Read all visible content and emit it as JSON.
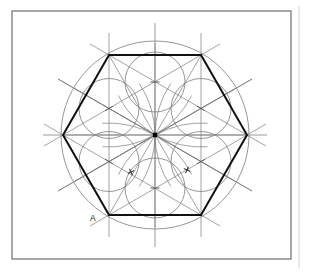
{
  "page": {
    "width": 312,
    "height": 274,
    "background": "#ffffff"
  },
  "frame": {
    "name": "drawing-border",
    "x": 12,
    "y": 11,
    "width": 279,
    "height": 248,
    "stroke": "#6e6e6e",
    "stroke_width": 1.2
  },
  "right_rule": {
    "name": "page-edge-rule",
    "x": 299,
    "y1": 6,
    "y2": 268,
    "stroke": "#cfcfcf",
    "stroke_width": 1
  },
  "caption": {
    "text": "",
    "color": "#c9c9c9"
  },
  "colors": {
    "heavy_line": "#111111",
    "thin_line": "#7a7a7a",
    "construction_line": "#8c8c8c",
    "circle_line": "#8a8a8a",
    "center_dot": "#000000",
    "label": "#1a1a1a"
  },
  "geometry": {
    "center": {
      "x": 155,
      "y": 135
    },
    "circumscribed_circle": {
      "name": "outer-circle",
      "cx": 155,
      "cy": 135,
      "r": 94,
      "stroke": "#8a8a8a",
      "stroke_width": 0.9
    },
    "hexagon": {
      "name": "hexagon",
      "circumradius": 92,
      "rotation_deg": 0,
      "stroke": "#111111",
      "stroke_width": 2.0,
      "vertices": [
        {
          "id": "V0",
          "x": 247,
          "y": 135,
          "label": ""
        },
        {
          "id": "V1",
          "x": 201,
          "y": 55,
          "label": ""
        },
        {
          "id": "V2",
          "x": 109,
          "y": 55,
          "label": ""
        },
        {
          "id": "V3",
          "x": 63,
          "y": 135,
          "label": ""
        },
        {
          "id": "V4",
          "x": 109,
          "y": 215,
          "label": "A"
        },
        {
          "id": "V5",
          "x": 201,
          "y": 215,
          "label": ""
        }
      ]
    },
    "inner_circles": {
      "name": "inscribed-circle-ring",
      "count": 6,
      "radius": 30,
      "ring_radius": 53,
      "stroke": "#8a8a8a",
      "stroke_width": 0.9,
      "centers": [
        {
          "x": 155,
          "y": 82
        },
        {
          "x": 201,
          "y": 108.5
        },
        {
          "x": 201,
          "y": 161.5
        },
        {
          "x": 155,
          "y": 188
        },
        {
          "x": 109,
          "y": 161.5
        },
        {
          "x": 109,
          "y": 108.5
        }
      ]
    },
    "axes": [
      {
        "name": "horizontal-centre-line",
        "angle_deg": 0,
        "half_length": 112
      },
      {
        "name": "vertical-centre-line",
        "angle_deg": 90,
        "half_length": 112
      },
      {
        "name": "diagonal-centre-line-30",
        "angle_deg": 30,
        "half_length": 112
      },
      {
        "name": "diagonal-centre-line-150",
        "angle_deg": 150,
        "half_length": 112
      }
    ],
    "radial_lines": {
      "name": "radial-construction-lines",
      "count": 12,
      "length": 92,
      "stroke": "#7a7a7a",
      "stroke_width": 0.7
    },
    "tick_marks": {
      "name": "bisector-tick-marks",
      "length": 9,
      "stroke": "#4a4a4a",
      "stroke_width": 0.9,
      "positions": [
        {
          "x": 155,
          "y": 82,
          "angle_deg": 0
        },
        {
          "x": 201,
          "y": 108.5,
          "angle_deg": 30
        },
        {
          "x": 201,
          "y": 161.5,
          "angle_deg": 150
        },
        {
          "x": 155,
          "y": 188,
          "angle_deg": 0
        },
        {
          "x": 109,
          "y": 161.5,
          "angle_deg": 30
        },
        {
          "x": 109,
          "y": 108.5,
          "angle_deg": 150
        }
      ]
    },
    "arc_intersection_marks": {
      "name": "compass-arc-crosses",
      "stroke": "#222222",
      "stroke_width": 1.0,
      "marks": [
        {
          "x": 131,
          "y": 172,
          "angle_deg": 20,
          "size": 7
        },
        {
          "x": 187,
          "y": 170,
          "angle_deg": -20,
          "size": 7
        }
      ]
    },
    "compass_arcs": {
      "name": "construction-arcs",
      "stroke": "#8c8c8c",
      "stroke_width": 0.8
    },
    "extended_chords": {
      "name": "extended-construction-chords",
      "stroke": "#8c8c8c",
      "stroke_width": 0.8,
      "overshoot": 22
    }
  },
  "labels": [
    {
      "name": "vertex-label-A",
      "text": "A",
      "x": 90,
      "y": 221
    }
  ]
}
